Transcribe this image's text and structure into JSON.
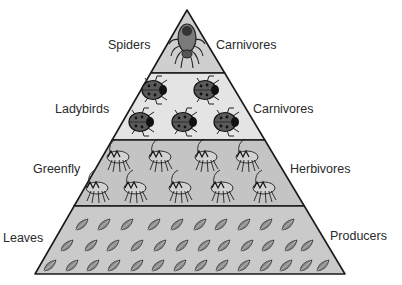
{
  "tiers": [
    {
      "organism": "Spiders",
      "role": "Carnivores",
      "count_rows": [
        1
      ],
      "fill": "#cfcfcf"
    },
    {
      "organism": "Ladybirds",
      "role": "Carnivores",
      "count_rows": [
        2,
        3
      ],
      "fill": "#e4e4e4"
    },
    {
      "organism": "Greenfly",
      "role": "Herbivores",
      "count_rows": [
        4,
        5
      ],
      "fill": "#c4c4c4"
    },
    {
      "organism": "Leaves",
      "role": "Producers",
      "count_rows": [
        10,
        12,
        14
      ],
      "fill": "#cacaca"
    }
  ],
  "colors": {
    "outline": "#1a1a1a",
    "text": "#2a2a2a",
    "ladybird": "#5a5a5a",
    "leaf": "#8a8a8a"
  }
}
